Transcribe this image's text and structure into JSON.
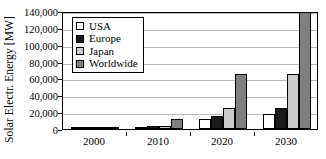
{
  "chart_data": {
    "type": "bar",
    "title": "",
    "xlabel": "",
    "ylabel": "Solar Electr. Energy [MW]",
    "categories": [
      "2000",
      "2010",
      "2020",
      "2030"
    ],
    "ylim": [
      0,
      140000
    ],
    "ytick_labels": [
      "140,000",
      "120,000",
      "100,000",
      "80,000",
      "60,000",
      "40,000",
      "20,000",
      "0"
    ],
    "ytick_values": [
      140000,
      120000,
      100000,
      80000,
      60000,
      40000,
      20000,
      0
    ],
    "grid": true,
    "legend_position": "top-left-inside",
    "series": [
      {
        "name": "USA",
        "color": "#ffffff",
        "values": [
          1000,
          2500,
          12000,
          18000
        ]
      },
      {
        "name": "Europe",
        "color": "#1a1a1a",
        "values": [
          1000,
          4000,
          15000,
          25000
        ]
      },
      {
        "name": "Japan",
        "color": "#cccccc",
        "values": [
          1000,
          3500,
          25000,
          65000
        ]
      },
      {
        "name": "Worldwide",
        "color": "#808080",
        "values": [
          1200,
          12000,
          65000,
          140000
        ]
      }
    ]
  }
}
